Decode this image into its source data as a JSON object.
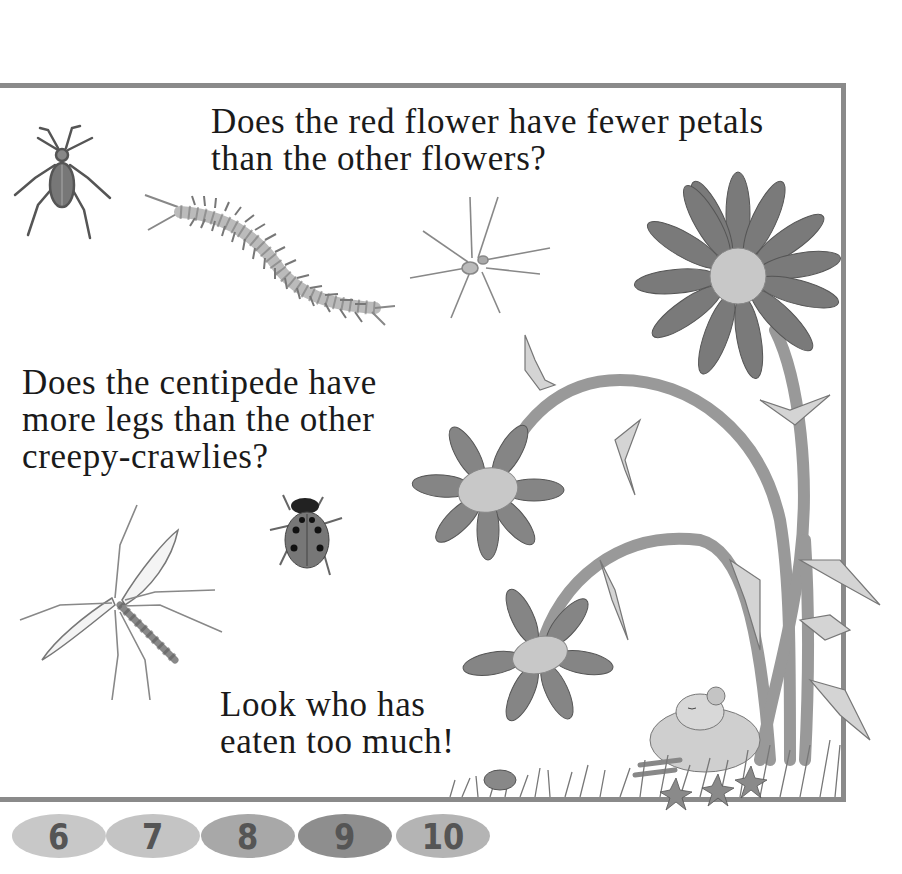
{
  "page": {
    "questions": [
      {
        "lines": [
          "Does the red flower have fewer petals",
          "than the other flowers?"
        ]
      },
      {
        "lines": [
          "Does the centipede have",
          "more legs than the other",
          "creepy-crawlies?"
        ]
      },
      {
        "lines": [
          "Look who has",
          "eaten too much!"
        ]
      }
    ],
    "illustrations": [
      "beetle",
      "centipede",
      "spider",
      "crane-fly",
      "ladybird",
      "red-flower",
      "flower",
      "flower",
      "thistle-stems",
      "sleeping-mouse",
      "grass"
    ]
  },
  "frame": {
    "color": "#8a8a8a"
  },
  "page_numbers": [
    {
      "label": "6",
      "color": "#c8c8c8"
    },
    {
      "label": "7",
      "color": "#c4c4c4"
    },
    {
      "label": "8",
      "color": "#a8a8a8"
    },
    {
      "label": "9",
      "color": "#8e8e8e"
    },
    {
      "label": "10",
      "color": "#b4b4b4"
    }
  ]
}
